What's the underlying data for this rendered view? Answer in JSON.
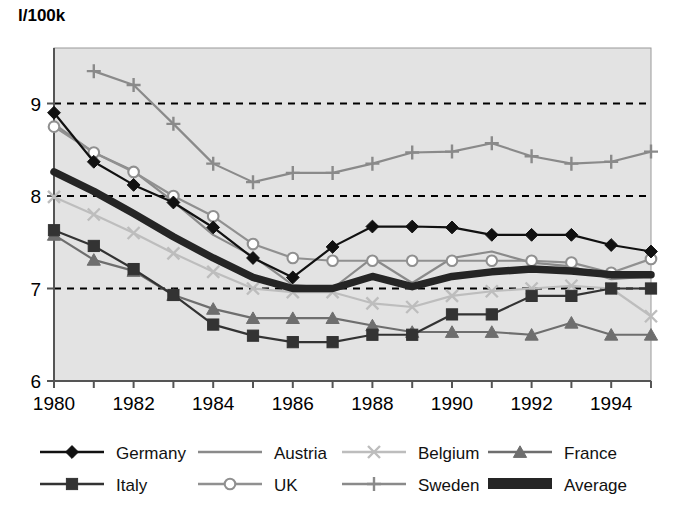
{
  "chart_data": {
    "type": "line",
    "title": "",
    "ylabel": "l/100k",
    "xlabel": "",
    "x": [
      1980,
      1981,
      1982,
      1983,
      1984,
      1985,
      1986,
      1987,
      1988,
      1989,
      1990,
      1991,
      1992,
      1993,
      1994,
      1995
    ],
    "xtick_labels": [
      "1980",
      "",
      "1982",
      "",
      "1984",
      "",
      "1986",
      "",
      "1988",
      "",
      "1990",
      "",
      "1992",
      "",
      "1994",
      ""
    ],
    "ytick_labels": [
      "6",
      "7",
      "8",
      "9"
    ],
    "yticks": [
      6,
      7,
      8,
      9
    ],
    "ylim": [
      6,
      9.6
    ],
    "xlim": [
      1980,
      1995
    ],
    "grid": "horizontal-dashed",
    "legend_position": "bottom",
    "series": [
      {
        "name": "Germany",
        "marker": "diamond",
        "color": "#111111",
        "values": [
          8.9,
          8.37,
          8.12,
          7.93,
          7.66,
          7.33,
          7.12,
          7.45,
          7.67,
          7.67,
          7.66,
          7.58,
          7.58,
          7.58,
          7.47,
          7.4
        ]
      },
      {
        "name": "Italy",
        "marker": "square",
        "color": "#333333",
        "values": [
          7.63,
          7.46,
          7.21,
          6.93,
          6.61,
          6.49,
          6.42,
          6.42,
          6.5,
          6.5,
          6.72,
          6.72,
          6.92,
          6.92,
          7.0,
          7.0
        ]
      },
      {
        "name": "Austria",
        "marker": "none",
        "color": "#8a8a8a",
        "values": [
          8.78,
          8.47,
          8.27,
          7.94,
          7.58,
          7.35,
          7.04,
          7.0,
          7.33,
          7.06,
          7.33,
          7.4,
          7.28,
          7.24,
          7.1,
          7.13
        ]
      },
      {
        "name": "UK",
        "marker": "circle-open",
        "color": "#909090",
        "values": [
          8.75,
          8.47,
          8.26,
          8.0,
          7.78,
          7.48,
          7.33,
          7.3,
          7.3,
          7.3,
          7.3,
          7.3,
          7.3,
          7.28,
          7.17,
          7.32
        ]
      },
      {
        "name": "Belgium",
        "marker": "x",
        "color": "#bdbdbd",
        "values": [
          7.99,
          7.8,
          7.6,
          7.38,
          7.18,
          7.0,
          6.96,
          6.96,
          6.84,
          6.8,
          6.92,
          6.97,
          7.0,
          7.03,
          7.0,
          6.7
        ]
      },
      {
        "name": "Sweden",
        "marker": "plus",
        "color": "#8a8a8a",
        "values": [
          null,
          9.35,
          9.2,
          8.78,
          8.35,
          8.15,
          8.25,
          8.25,
          8.35,
          8.47,
          8.48,
          8.57,
          8.43,
          8.35,
          8.37,
          8.48
        ]
      },
      {
        "name": "France",
        "marker": "triangle",
        "color": "#6e6e6e",
        "values": [
          7.58,
          7.31,
          7.19,
          6.93,
          6.78,
          6.68,
          6.68,
          6.68,
          6.6,
          6.53,
          6.53,
          6.53,
          6.5,
          6.63,
          6.5,
          6.5
        ]
      },
      {
        "name": "Average",
        "marker": "thick-line",
        "color": "#252525",
        "values": [
          8.26,
          8.05,
          7.81,
          7.56,
          7.33,
          7.12,
          7.0,
          7.0,
          7.13,
          7.02,
          7.13,
          7.18,
          7.21,
          7.19,
          7.15,
          7.15
        ]
      }
    ]
  },
  "legend": {
    "entries": [
      {
        "label": "Germany",
        "key": "germany"
      },
      {
        "label": "Austria",
        "key": "austria"
      },
      {
        "label": "Belgium",
        "key": "belgium"
      },
      {
        "label": "France",
        "key": "france"
      },
      {
        "label": "Italy",
        "key": "italy"
      },
      {
        "label": "UK",
        "key": "uk"
      },
      {
        "label": "Sweden",
        "key": "sweden"
      },
      {
        "label": "Average",
        "key": "average"
      }
    ]
  },
  "colors": {
    "plot_background": "#e3e3e3",
    "page_background": "#ffffff",
    "axis": "#555555",
    "gridline": "#000000"
  }
}
